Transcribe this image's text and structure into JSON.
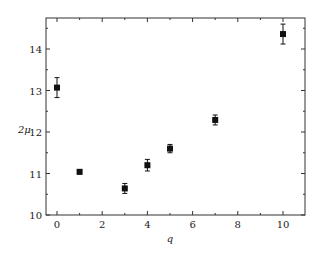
{
  "chart_data": {
    "type": "scatter",
    "title": "",
    "xlabel": "q",
    "ylabel": "2μ",
    "xlim": [
      -0.5,
      10.8
    ],
    "ylim": [
      10,
      14.8
    ],
    "x_ticks": [
      0,
      2,
      4,
      6,
      8,
      10
    ],
    "y_ticks": [
      10,
      11,
      12,
      13,
      14
    ],
    "grid": false,
    "legend": null,
    "series": [
      {
        "name": "2μ vs q",
        "marker": "square",
        "x": [
          0,
          1,
          3,
          4,
          5,
          7,
          10
        ],
        "y": [
          13.07,
          11.04,
          10.64,
          11.2,
          11.6,
          12.29,
          14.36
        ],
        "yerr": [
          0.24,
          0.05,
          0.12,
          0.14,
          0.1,
          0.12,
          0.24
        ]
      }
    ]
  }
}
